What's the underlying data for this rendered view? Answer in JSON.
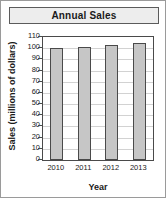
{
  "chart_data": {
    "type": "bar",
    "title": "Annual Sales",
    "xlabel": "Year",
    "ylabel": "Sales (millions of dollars)",
    "categories": [
      "2010",
      "2011",
      "2012",
      "2013"
    ],
    "values": [
      100,
      101.5,
      103,
      104.5
    ],
    "ylim": [
      0,
      110
    ],
    "ytick_labels": [
      "110",
      "100",
      "90",
      "80",
      "70",
      "60",
      "50",
      "40",
      "30",
      "20",
      "10",
      "0"
    ],
    "ytick_values": [
      110,
      100,
      90,
      80,
      70,
      60,
      50,
      40,
      30,
      20,
      10,
      0
    ],
    "ytick_step": 10,
    "grid": true,
    "legend": "none",
    "bar_fill_color": "#c6c6c6",
    "bar_edge_color": "#4a4a4a",
    "gridline_color": "#d2d2d2",
    "axis_color": "#4a4a4a",
    "title_bar_background": "#ededed",
    "title_bar_border": "#5b5b5b",
    "figure_border": "#9a9a9a",
    "background": "#ffffff"
  }
}
